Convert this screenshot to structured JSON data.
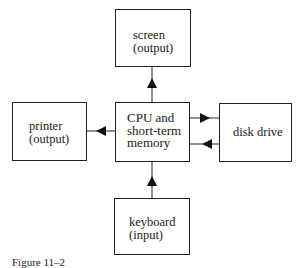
{
  "diagram": {
    "nodes": {
      "screen": {
        "line1": "screen",
        "line2": "(output)"
      },
      "printer": {
        "line1": "printer",
        "line2": "(output)"
      },
      "cpu": {
        "line1": "CPU and",
        "line2": "short-term",
        "line3": "memory"
      },
      "disk": {
        "line1": "disk drive"
      },
      "keyboard": {
        "line1": "keyboard",
        "line2": "(input)"
      }
    },
    "edges": [
      {
        "from": "cpu",
        "to": "screen"
      },
      {
        "from": "cpu",
        "to": "printer"
      },
      {
        "from": "cpu",
        "to": "disk"
      },
      {
        "from": "disk",
        "to": "cpu"
      },
      {
        "from": "keyboard",
        "to": "cpu"
      }
    ],
    "caption": "Figure 11–2"
  }
}
